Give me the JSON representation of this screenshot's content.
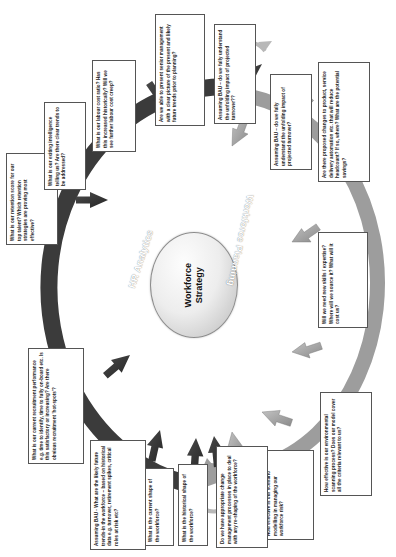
{
  "diagram": {
    "title": "Workforce Strategy",
    "center": {
      "label": "Workforce\nStrategy"
    },
    "bands": [
      {
        "id": "hr-analytics",
        "label": "HR Analytics",
        "color": "#3d3d3d"
      },
      {
        "id": "workforce-planning",
        "label": "Workforce Planning",
        "color": "#9a9a9a"
      }
    ],
    "colors": {
      "analytics_arrow": "#3b3b3b",
      "planning_arrow": "#9d9d9d",
      "box_border": "#555555",
      "box_fill": "#ffffff",
      "core_fill": "#e6e6e6",
      "connector": "#b0b0b0"
    },
    "questions": [
      {
        "id": "retention-score",
        "group": "hr-analytics",
        "text": "What is our retention score for our top talent? Which retention strategies are proving most effective?"
      },
      {
        "id": "exiting-intelligence",
        "group": "hr-analytics",
        "text": "What is our exiting intelligence telling us? Are there clear trends to be addressed?"
      },
      {
        "id": "labour-cost-ratio",
        "group": "hr-analytics",
        "text": "What is our labour cost ratio? Has this increased historically? Will we see further labour cost creep?"
      },
      {
        "id": "present-to-senior-management",
        "group": "hr-analytics",
        "text": "Are we able to present senior management with a clear picture of the present and likely future trends prior to planning?"
      },
      {
        "id": "bau-turnover-analytics",
        "group": "hr-analytics",
        "text": "Assuming BAU – do we fully understand the unfolding impact of projected turnover??"
      },
      {
        "id": "bau-turnover-planning",
        "group": "workforce-planning",
        "text": "Assuming BAU – do we fully understand the unfolding impact of projected turnover?"
      },
      {
        "id": "proposed-changes",
        "group": "workforce-planning",
        "text": "Are there proposed changes to product, service delivery automation etc. that will reduce headcount? If so, where? What are the potential savings?"
      },
      {
        "id": "new-skills",
        "group": "workforce-planning",
        "text": "Will we need new skills / expertise? Where will we source it? What will it cost us?"
      },
      {
        "id": "environmental-scanning",
        "group": "workforce-planning",
        "text": "How effective is our environmental scanning process? Does our model cover all the criteria relevant to us?"
      },
      {
        "id": "scenario-modelling",
        "group": "workforce-planning",
        "text": "How effective is our scenario modelling in managing our workforce risk?"
      },
      {
        "id": "change-management",
        "group": "workforce-planning",
        "text": "Do we have appropriate change management processes in place to deal with any re-shaping of the workforce?"
      },
      {
        "id": "historical-shape",
        "group": "hr-analytics",
        "text": "What is the historical shape of the workforce?"
      },
      {
        "id": "current-shape",
        "group": "hr-analytics",
        "text": "What is the current shape of the workforce?"
      },
      {
        "id": "bau-future-trends",
        "group": "hr-analytics",
        "text": "Assuming BAU - What are the likely future trends-in the workforce – based on historical data e.g. turnover, retirement spikes, critical roles at risk etc?"
      },
      {
        "id": "recruitment-performance",
        "group": "hr-analytics",
        "text": "What is our current recruitment performance e.g. time to identify, time to fully on-board etc. Is this satisfactory or increasing? Are there obvious recruitment 'hot-spots'?"
      }
    ]
  }
}
